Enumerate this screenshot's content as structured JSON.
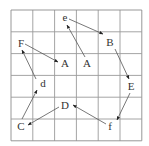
{
  "diagram": {
    "type": "grid-arrow-puzzle",
    "grid": {
      "rows": 6,
      "cols": 6,
      "left": 11,
      "top": 10,
      "cell": 21.8,
      "line_color": "#9a9a9a",
      "border_color": "#8c8c8c"
    },
    "arrow_color": "#555555",
    "labels": [
      {
        "id": "e",
        "text": "e",
        "x": 65,
        "y": 21
      },
      {
        "id": "B",
        "text": "B",
        "x": 110,
        "y": 46
      },
      {
        "id": "F",
        "text": "F",
        "x": 21,
        "y": 47
      },
      {
        "id": "A1",
        "text": "A",
        "x": 65,
        "y": 67
      },
      {
        "id": "A2",
        "text": "A",
        "x": 87,
        "y": 67
      },
      {
        "id": "d",
        "text": "d",
        "x": 43,
        "y": 87
      },
      {
        "id": "E",
        "text": "E",
        "x": 131,
        "y": 90
      },
      {
        "id": "D",
        "text": "D",
        "x": 65,
        "y": 109
      },
      {
        "id": "C",
        "text": "C",
        "x": 21,
        "y": 130
      },
      {
        "id": "f",
        "text": "f",
        "x": 110,
        "y": 130
      }
    ],
    "arrows": [
      {
        "from": "e",
        "to": "B",
        "x1": 69,
        "y1": 19,
        "x2": 103,
        "y2": 34
      },
      {
        "from": "B",
        "to": "E",
        "x1": 115,
        "y1": 49,
        "x2": 129,
        "y2": 79
      },
      {
        "from": "E",
        "to": "f",
        "x1": 130,
        "y1": 93,
        "x2": 117,
        "y2": 120
      },
      {
        "from": "f",
        "to": "D",
        "x1": 106,
        "y1": 124,
        "x2": 73,
        "y2": 105
      },
      {
        "from": "D",
        "to": "C",
        "x1": 59,
        "y1": 107,
        "x2": 28,
        "y2": 125
      },
      {
        "from": "C",
        "to": "d",
        "x1": 22,
        "y1": 119,
        "x2": 37,
        "y2": 90
      },
      {
        "from": "d",
        "to": "F",
        "x1": 36,
        "y1": 79,
        "x2": 22,
        "y2": 50
      },
      {
        "from": "F",
        "to": "A1",
        "x1": 25,
        "y1": 44,
        "x2": 58,
        "y2": 62
      },
      {
        "from": "A2",
        "to": "e",
        "x1": 85,
        "y1": 57,
        "x2": 67,
        "y2": 25
      }
    ]
  }
}
